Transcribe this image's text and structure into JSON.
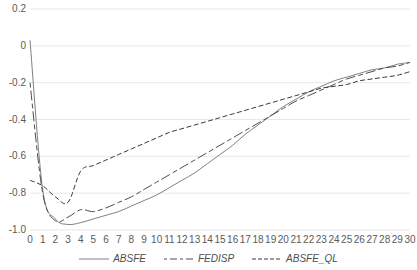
{
  "chart_data": {
    "type": "line",
    "title": "",
    "xlabel": "",
    "ylabel": "",
    "xlim": [
      0,
      30
    ],
    "ylim": [
      -1.0,
      0.2
    ],
    "grid": true,
    "legend_position": "bottom",
    "x": [
      0,
      1,
      2,
      3,
      4,
      5,
      6,
      7,
      8,
      9,
      10,
      11,
      12,
      13,
      14,
      15,
      16,
      17,
      18,
      19,
      20,
      21,
      22,
      23,
      24,
      25,
      26,
      27,
      28,
      29,
      30
    ],
    "x_tick_labels": [
      "0",
      "1",
      "2",
      "3",
      "4",
      "5",
      "6",
      "7",
      "8",
      "9",
      "10",
      "11",
      "12",
      "13",
      "14",
      "15",
      "16",
      "17",
      "18",
      "19",
      "20",
      "21",
      "22",
      "23",
      "24",
      "25",
      "26",
      "27",
      "28",
      "29",
      "30"
    ],
    "y_tick_labels": [
      "0.2",
      "0",
      "-0.2",
      "-0.4",
      "-0.6",
      "-0.8",
      "-1.0"
    ],
    "y_ticks": [
      0.2,
      0,
      -0.2,
      -0.4,
      -0.6,
      -0.8,
      -1.0
    ],
    "series": [
      {
        "name": "ABSFE",
        "style": "solid",
        "color": "#808080",
        "values": [
          0.03,
          -0.78,
          -0.94,
          -0.97,
          -0.96,
          -0.94,
          -0.92,
          -0.9,
          -0.87,
          -0.84,
          -0.81,
          -0.77,
          -0.73,
          -0.69,
          -0.64,
          -0.59,
          -0.54,
          -0.48,
          -0.43,
          -0.38,
          -0.33,
          -0.29,
          -0.25,
          -0.22,
          -0.19,
          -0.17,
          -0.15,
          -0.13,
          -0.12,
          -0.1,
          -0.09
        ]
      },
      {
        "name": "FEDISP",
        "style": "dashed",
        "color": "#4d4d4d",
        "values": [
          -0.2,
          -0.8,
          -0.95,
          -0.93,
          -0.89,
          -0.9,
          -0.88,
          -0.85,
          -0.82,
          -0.78,
          -0.74,
          -0.7,
          -0.66,
          -0.62,
          -0.58,
          -0.54,
          -0.5,
          -0.46,
          -0.42,
          -0.38,
          -0.34,
          -0.3,
          -0.27,
          -0.24,
          -0.21,
          -0.18,
          -0.16,
          -0.14,
          -0.12,
          -0.11,
          -0.09
        ]
      },
      {
        "name": "ABSFE_QL",
        "style": "dotted-dash",
        "color": "#3a3a3a",
        "values": [
          -0.73,
          -0.76,
          -0.82,
          -0.85,
          -0.68,
          -0.65,
          -0.62,
          -0.59,
          -0.56,
          -0.53,
          -0.5,
          -0.47,
          -0.45,
          -0.43,
          -0.41,
          -0.39,
          -0.37,
          -0.35,
          -0.33,
          -0.31,
          -0.29,
          -0.27,
          -0.25,
          -0.23,
          -0.22,
          -0.21,
          -0.19,
          -0.18,
          -0.17,
          -0.16,
          -0.14
        ]
      }
    ]
  },
  "legend": {
    "items": [
      {
        "label": "ABSFE"
      },
      {
        "label": "FEDISP"
      },
      {
        "label": "ABSFE_QL"
      }
    ]
  },
  "colors": {
    "grid": "#e8e8e8",
    "axis_text": "#5a5a5a",
    "series_solid": "#808080",
    "series_dashed": "#4d4d4d",
    "series_dotted": "#3a3a3a"
  }
}
